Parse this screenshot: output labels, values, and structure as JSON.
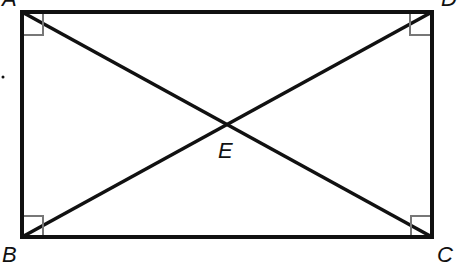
{
  "diagram": {
    "type": "rectangle-with-diagonals",
    "colors": {
      "stroke": "#111111",
      "right_angle_marker": "#777777",
      "background": "#ffffff"
    },
    "vertices": {
      "A": {
        "label": "A",
        "x": 22,
        "y": 12
      },
      "D": {
        "label": "D",
        "x": 432,
        "y": 12
      },
      "B": {
        "label": "B",
        "x": 22,
        "y": 237
      },
      "C": {
        "label": "C",
        "x": 432,
        "y": 237
      }
    },
    "intersection": {
      "label": "E",
      "x": 226,
      "y": 124
    },
    "diagonals": [
      "AC",
      "BD"
    ],
    "right_angles": [
      "A",
      "D",
      "B",
      "C"
    ]
  }
}
